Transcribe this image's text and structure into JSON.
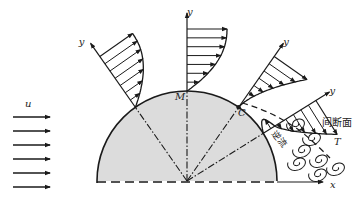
{
  "diagram": {
    "labels": {
      "freestream": "u",
      "top_point": "M",
      "separation_point": "C",
      "y_axis": "y",
      "x_axis": "x",
      "discontinuity": "间断面",
      "backflow": "逆流",
      "wake": "T"
    },
    "colors": {
      "stroke": "#1a1a1a",
      "body_fill": "#dcdcdc",
      "background": "#ffffff"
    },
    "freestream_arrow_count": 6,
    "profiles": [
      {
        "name": "profile-upstream",
        "angle_deg": 125,
        "type": "attached"
      },
      {
        "name": "profile-top",
        "angle_deg": 90,
        "type": "attached"
      },
      {
        "name": "profile-separation",
        "angle_deg": 55,
        "type": "separation"
      },
      {
        "name": "profile-reversed",
        "angle_deg": 32,
        "type": "reversed"
      }
    ],
    "vortex_count": 7
  }
}
